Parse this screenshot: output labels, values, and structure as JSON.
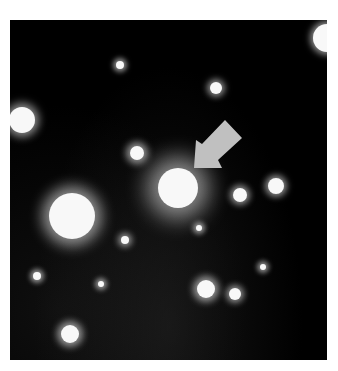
{
  "image": {
    "description": "Astronomical field with stars and a fuzzy galaxy indicated by a gray arrow",
    "background": "#000000",
    "arrow_color": "#c0c0c0",
    "stars": [
      {
        "x": 120,
        "y": 65,
        "r": 4,
        "glow": 5
      },
      {
        "x": 216,
        "y": 88,
        "r": 6,
        "glow": 6
      },
      {
        "x": 22,
        "y": 120,
        "r": 13,
        "glow": 8
      },
      {
        "x": 327,
        "y": 38,
        "r": 14,
        "glow": 6
      },
      {
        "x": 137,
        "y": 153,
        "r": 7,
        "glow": 7
      },
      {
        "x": 178,
        "y": 188,
        "r": 20,
        "glow": 22
      },
      {
        "x": 240,
        "y": 195,
        "r": 7,
        "glow": 6
      },
      {
        "x": 276,
        "y": 186,
        "r": 8,
        "glow": 6
      },
      {
        "x": 72,
        "y": 216,
        "r": 23,
        "glow": 14
      },
      {
        "x": 125,
        "y": 240,
        "r": 4,
        "glow": 6
      },
      {
        "x": 199,
        "y": 228,
        "r": 3,
        "glow": 5
      },
      {
        "x": 37,
        "y": 276,
        "r": 4,
        "glow": 5
      },
      {
        "x": 101,
        "y": 284,
        "r": 3,
        "glow": 5
      },
      {
        "x": 206,
        "y": 289,
        "r": 9,
        "glow": 7
      },
      {
        "x": 235,
        "y": 294,
        "r": 6,
        "glow": 6
      },
      {
        "x": 70,
        "y": 334,
        "r": 9,
        "glow": 7
      },
      {
        "x": 263,
        "y": 267,
        "r": 3,
        "glow": 5
      }
    ]
  }
}
